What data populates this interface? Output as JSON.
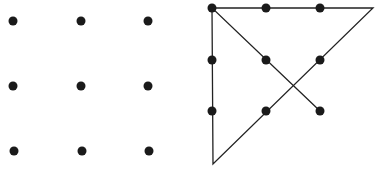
{
  "diagram": {
    "colors": {
      "dot": "#1a1a1a",
      "line": "#222222",
      "background": "#ffffff"
    },
    "dot_radius": 4.5,
    "unsolved_grid": {
      "dots": [
        {
          "x": 13,
          "y": 21
        },
        {
          "x": 81,
          "y": 21
        },
        {
          "x": 148,
          "y": 21
        },
        {
          "x": 13,
          "y": 86
        },
        {
          "x": 81,
          "y": 86
        },
        {
          "x": 148,
          "y": 86
        },
        {
          "x": 14,
          "y": 151
        },
        {
          "x": 82,
          "y": 151
        },
        {
          "x": 149,
          "y": 151
        }
      ]
    },
    "solved_grid": {
      "dots": [
        {
          "x": 212,
          "y": 8
        },
        {
          "x": 266,
          "y": 8
        },
        {
          "x": 320,
          "y": 8
        },
        {
          "x": 212,
          "y": 60
        },
        {
          "x": 266,
          "y": 60
        },
        {
          "x": 320,
          "y": 60
        },
        {
          "x": 212,
          "y": 111
        },
        {
          "x": 266,
          "y": 111
        },
        {
          "x": 320,
          "y": 111
        }
      ],
      "path": [
        {
          "x": 320,
          "y": 111
        },
        {
          "x": 212,
          "y": 8
        },
        {
          "x": 373,
          "y": 8
        },
        {
          "x": 213,
          "y": 164
        },
        {
          "x": 212,
          "y": 8
        }
      ]
    }
  }
}
